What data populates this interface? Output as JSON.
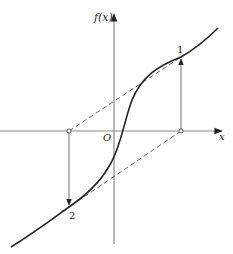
{
  "diagram": {
    "type": "function-iteration-plot",
    "axes": {
      "x_label": "x",
      "y_label": "f(x)",
      "origin_label": "O",
      "axis_color": "#8a8a8a"
    },
    "curve": {
      "description": "increasing S-shaped curve f(x)",
      "color": "#222222"
    },
    "points": [
      {
        "label": "1",
        "description": "point on curve above positive x value"
      },
      {
        "label": "2",
        "description": "point on curve below negative x value"
      }
    ],
    "guides": {
      "dashed_color": "#555555",
      "arrow_color": "#222222"
    }
  }
}
